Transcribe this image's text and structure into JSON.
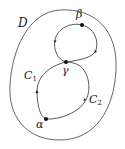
{
  "diagram": {
    "region_label": "D",
    "points": {
      "alpha": {
        "label": "α",
        "x": 46,
        "y": 119
      },
      "beta": {
        "label": "β",
        "x": 82,
        "y": 25
      },
      "gamma": {
        "label": "γ",
        "x": 66,
        "y": 62
      }
    },
    "curves": {
      "c1": {
        "label": "C",
        "subscript": "1"
      },
      "c2": {
        "label": "C",
        "subscript": "2"
      }
    },
    "colors": {
      "stroke": "#444444",
      "point": "#111111",
      "background": "#ffffff"
    }
  }
}
